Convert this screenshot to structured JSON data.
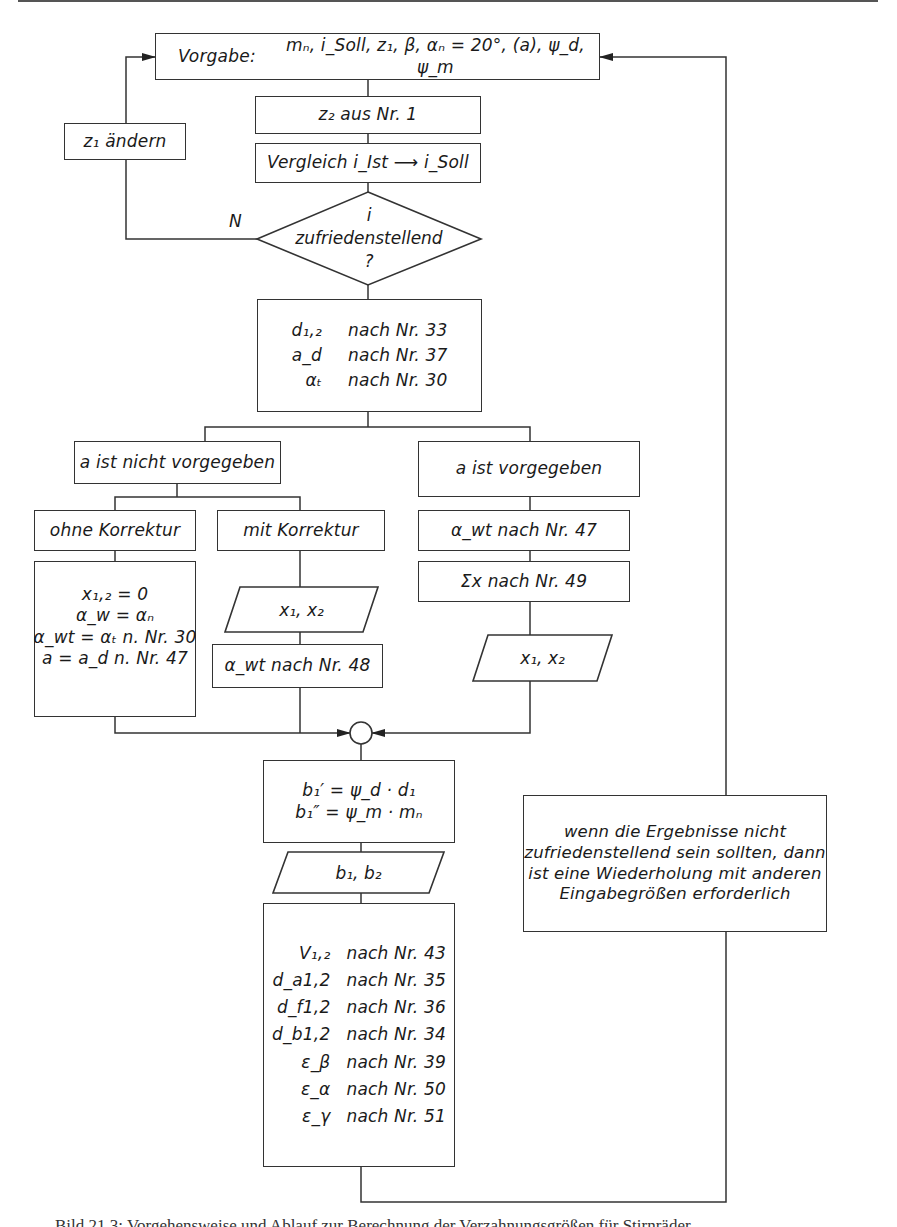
{
  "flowchart": {
    "start": {
      "label": "Vorgabe:",
      "params": "mₙ, i_Soll, z₁, β, αₙ = 20°, (a), ψ_d, ψ_m"
    },
    "z2_step": {
      "text": "z₂   aus Nr. 1"
    },
    "compare_step": {
      "text": "Vergleich  i_Ist ⟶ i_Soll"
    },
    "decision": {
      "lines": [
        "i",
        "zufriedenstellend",
        "?"
      ],
      "no_label": "N"
    },
    "z1_change": {
      "text": "z₁   ändern"
    },
    "calc_basic": {
      "rows": [
        {
          "sym": "d₁,₂",
          "ref": "nach Nr. 33"
        },
        {
          "sym": "a_d",
          "ref": "nach Nr. 37"
        },
        {
          "sym": "αₜ",
          "ref": "nach Nr. 30"
        }
      ]
    },
    "branch_not_given": {
      "text": "a ist nicht vorgegeben"
    },
    "branch_given": {
      "text": "a ist vorgegeben"
    },
    "without_correction": {
      "text": "ohne Korrektur"
    },
    "with_correction": {
      "text": "mit Korrektur"
    },
    "without_correction_calc": {
      "lines": [
        "x₁,₂ = 0",
        "α_w = αₙ",
        "α_wt = αₜ n. Nr. 30",
        "a = a_d n. Nr. 47"
      ]
    },
    "with_correction_input": {
      "text": "x₁, x₂"
    },
    "with_correction_calc": {
      "text": "α_wt   nach Nr. 48"
    },
    "given_calc_1": {
      "text": "α_wt   nach Nr. 47"
    },
    "given_calc_2": {
      "text": "Σx   nach Nr. 49"
    },
    "given_output": {
      "text": "x₁, x₂"
    },
    "width_calc": {
      "lines": [
        "b₁′ = ψ_d · d₁",
        "b₁″ = ψ_m · mₙ"
      ]
    },
    "width_output": {
      "text": "b₁, b₂"
    },
    "results": {
      "rows": [
        {
          "sym": "V₁,₂",
          "ref": "nach Nr. 43"
        },
        {
          "sym": "d_a1,2",
          "ref": "nach Nr. 35"
        },
        {
          "sym": "d_f1,2",
          "ref": "nach Nr. 36"
        },
        {
          "sym": "d_b1,2",
          "ref": "nach Nr. 34"
        },
        {
          "sym": "ε_β",
          "ref": "nach Nr. 39"
        },
        {
          "sym": "ε_α",
          "ref": "nach Nr. 50"
        },
        {
          "sym": "ε_γ",
          "ref": "nach Nr. 51"
        }
      ]
    },
    "retry_note": {
      "lines": [
        "wenn die Ergebnisse nicht",
        "zufriedenstellend sein sollten, dann",
        "ist eine Wiederholung mit anderen",
        "Eingabegrößen erforderlich"
      ]
    }
  },
  "caption": {
    "text": "Bild 21.3: Vorgehensweise und Ablauf zur Berechnung der Verzahnungsgrößen für Stirnräder"
  },
  "colors": {
    "line": "#333333",
    "background": "#ffffff"
  }
}
